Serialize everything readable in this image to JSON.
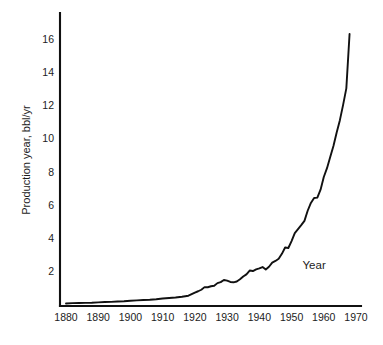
{
  "chart_data": {
    "type": "line",
    "title": "",
    "subtitle": "",
    "xlabel": "Year",
    "ylabel": "Production year, bbl/yr",
    "xlim": [
      1880,
      1970
    ],
    "ylim": [
      0,
      17
    ],
    "grid": false,
    "legend": null,
    "x_ticks": [
      "1880",
      "1890",
      "1900",
      "1910",
      "1920",
      "1930",
      "1940",
      "1950",
      "1960",
      "1970"
    ],
    "x_tick_values": [
      1880,
      1890,
      1900,
      1910,
      1920,
      1930,
      1940,
      1950,
      1960,
      1970
    ],
    "y_ticks": [
      "2",
      "4",
      "6",
      "8",
      "10",
      "12",
      "14",
      "16"
    ],
    "y_tick_values": [
      2,
      4,
      6,
      8,
      10,
      12,
      14,
      16
    ],
    "annotations": [
      {
        "text": "Year",
        "x": 1957,
        "y": 2.1
      }
    ],
    "series": [
      {
        "name": "World crude oil production",
        "x": [
          1880,
          1882,
          1884,
          1886,
          1888,
          1890,
          1892,
          1894,
          1896,
          1898,
          1900,
          1902,
          1904,
          1906,
          1908,
          1910,
          1912,
          1914,
          1916,
          1918,
          1920,
          1921,
          1922,
          1923,
          1924,
          1925,
          1926,
          1927,
          1928,
          1929,
          1930,
          1931,
          1932,
          1933,
          1934,
          1935,
          1936,
          1937,
          1938,
          1939,
          1940,
          1941,
          1942,
          1943,
          1944,
          1945,
          1946,
          1947,
          1948,
          1949,
          1950,
          1951,
          1952,
          1953,
          1954,
          1955,
          1956,
          1957,
          1958,
          1959,
          1960,
          1961,
          1962,
          1963,
          1964,
          1965,
          1966,
          1967,
          1968
        ],
        "values": [
          0.03,
          0.05,
          0.06,
          0.07,
          0.08,
          0.1,
          0.12,
          0.13,
          0.15,
          0.17,
          0.2,
          0.22,
          0.24,
          0.26,
          0.29,
          0.33,
          0.36,
          0.39,
          0.44,
          0.5,
          0.69,
          0.77,
          0.86,
          1.02,
          1.01,
          1.07,
          1.1,
          1.26,
          1.32,
          1.45,
          1.41,
          1.33,
          1.31,
          1.36,
          1.49,
          1.66,
          1.79,
          2.02,
          1.99,
          2.09,
          2.15,
          2.23,
          2.08,
          2.25,
          2.5,
          2.6,
          2.73,
          3.03,
          3.41,
          3.38,
          3.8,
          4.28,
          4.52,
          4.76,
          5.02,
          5.63,
          6.1,
          6.4,
          6.42,
          6.9,
          7.67,
          8.2,
          8.88,
          9.54,
          10.36,
          11.1,
          12.02,
          13.02,
          16.3
        ]
      }
    ]
  },
  "axes": {
    "y_axis_title": "Production year, bbl/yr",
    "x_axis_title": "Year"
  }
}
